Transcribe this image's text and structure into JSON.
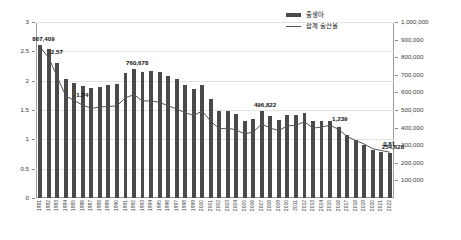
{
  "chart_data": {
    "type": "bar",
    "title": "",
    "subtitle": "",
    "xlabel": "",
    "ylabel": "",
    "grid": true,
    "legend_position": "top-right",
    "left_axis": {
      "name": "합계 출산율",
      "ylim": [
        0,
        3
      ],
      "ticks": [
        "0",
        "0.5",
        "1",
        "1.5",
        "2",
        "2.5",
        "3"
      ]
    },
    "right_axis": {
      "name": "출생아",
      "ylim": [
        0,
        1000000
      ],
      "ticks": [
        "100,000",
        "200,000",
        "300,000",
        "400,000",
        "500,000",
        "600,000",
        "700,000",
        "800,000",
        "900,000",
        "1,000,000"
      ]
    },
    "categories": [
      "1981",
      "1982",
      "1983",
      "1984",
      "1985",
      "1986",
      "1987",
      "1988",
      "1989",
      "1990",
      "1991",
      "1992",
      "1993",
      "1994",
      "1995",
      "1996",
      "1997",
      "1998",
      "1999",
      "2000",
      "2001",
      "2002",
      "2003",
      "2004",
      "2005",
      "2006",
      "2007",
      "2008",
      "2009",
      "2010",
      "2011",
      "2012",
      "2013",
      "2014",
      "2015",
      "2016",
      "2017",
      "2018",
      "2019",
      "2020",
      "2021",
      "2022"
    ],
    "series": [
      {
        "name": "출생아",
        "axis": "right",
        "type": "bar",
        "values": [
          867409,
          848312,
          769155,
          674793,
          655489,
          636019,
          623831,
          633092,
          639431,
          649738,
          709275,
          730678,
          715826,
          721185,
          715020,
          691226,
          675394,
          641594,
          620668,
          640089,
          559934,
          496911,
          495036,
          476958,
          438707,
          451759,
          496822,
          465892,
          444849,
          470171,
          471265,
          484550,
          436455,
          435435,
          438420,
          406243,
          357771,
          326822,
          302676,
          272337,
          260562,
          254628
        ]
      },
      {
        "name": "합계 출산율",
        "axis": "left",
        "type": "line",
        "values": [
          2.57,
          2.39,
          2.06,
          1.74,
          1.66,
          1.58,
          1.53,
          1.55,
          1.56,
          1.57,
          1.71,
          1.76,
          1.654,
          1.656,
          1.63,
          1.57,
          1.52,
          1.45,
          1.41,
          1.48,
          1.31,
          1.18,
          1.19,
          1.16,
          1.09,
          1.13,
          1.26,
          1.19,
          1.15,
          1.23,
          1.24,
          1.3,
          1.19,
          1.21,
          1.24,
          1.17,
          1.05,
          0.98,
          0.92,
          0.84,
          0.81,
          0.78
        ]
      }
    ],
    "annotations": [
      {
        "text": "867,409",
        "series": "출생아",
        "category": "1981"
      },
      {
        "text": "2.57",
        "series": "합계 출산율",
        "category": "1982"
      },
      {
        "text": "1.74",
        "series": "합계 출산율",
        "category": "1985"
      },
      {
        "text": "760,678",
        "series": "출생아",
        "category": "1992"
      },
      {
        "text": "496,822",
        "series": "출생아",
        "category": "2007"
      },
      {
        "text": "1,239",
        "series": "합계 출산율",
        "category": "2015"
      },
      {
        "text": "0.81",
        "series": "합계 출산율",
        "category": "2021"
      },
      {
        "text": "254,628",
        "series": "출생아",
        "category": "2022"
      }
    ]
  },
  "legend": {
    "items": [
      {
        "label": "출생아",
        "marker": "bar-swatch"
      },
      {
        "label": "합계 출산율",
        "marker": "line-swatch"
      }
    ]
  },
  "colors": {
    "bar": "#4a4a4a",
    "line": "#555555",
    "grid": "#e4e4e4",
    "axis": "#9a9a9a",
    "text": "#333333",
    "background": "#ffffff"
  }
}
